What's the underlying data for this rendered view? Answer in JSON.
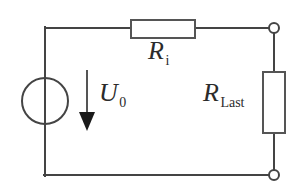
{
  "figure": {
    "background_color": "#ffffff",
    "line_color": "#444444",
    "text_color": "#2b2b2b",
    "width": 305,
    "height": 189
  },
  "labels": {
    "source_voltage": {
      "base": "U",
      "subscript": "0",
      "name": "U_0"
    },
    "internal_resistance": {
      "base": "R",
      "subscript": "i",
      "name": "R_i"
    },
    "load_resistance": {
      "base": "R",
      "subscript": "Last",
      "name": "R_Last"
    }
  },
  "components": {
    "voltage_source": {
      "type": "ideal-voltage-source",
      "symbol": "circle",
      "center_x": 45,
      "center_y": 101,
      "radius": 23
    },
    "resistor_internal": {
      "type": "resistor",
      "orientation": "horizontal",
      "x": 131,
      "y": 20,
      "width": 64,
      "height": 18
    },
    "resistor_load": {
      "type": "resistor",
      "orientation": "vertical",
      "x": 263,
      "y": 72,
      "width": 22,
      "height": 61
    },
    "voltage_arrow": {
      "type": "arrow",
      "direction": "down",
      "x": 87,
      "y_start": 70,
      "y_end": 130
    },
    "terminal_top": {
      "type": "open-terminal",
      "cx": 274,
      "cy": 28,
      "r": 5
    },
    "terminal_bottom": {
      "type": "open-terminal",
      "cx": 274,
      "cy": 175,
      "r": 5
    }
  },
  "wires": [
    {
      "name": "top-left-wire",
      "x1": 45,
      "y1": 28,
      "x2": 131,
      "y2": 28
    },
    {
      "name": "top-right-wire",
      "x1": 195,
      "y1": 28,
      "x2": 274,
      "y2": 28
    },
    {
      "name": "left-wire",
      "x1": 45,
      "y1": 28,
      "x2": 45,
      "y2": 175
    },
    {
      "name": "bottom-wire",
      "x1": 45,
      "y1": 175,
      "x2": 274,
      "y2": 175
    },
    {
      "name": "right-upper-wire",
      "x1": 274,
      "y1": 28,
      "x2": 274,
      "y2": 72
    },
    {
      "name": "right-lower-wire",
      "x1": 274,
      "y1": 133,
      "x2": 274,
      "y2": 175
    }
  ]
}
